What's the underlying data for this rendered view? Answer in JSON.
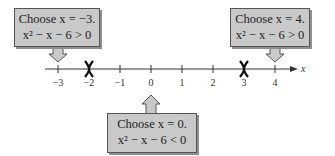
{
  "diagram": {
    "type": "sign-test-number-line",
    "axis": {
      "variable": "x",
      "ticks": [
        {
          "value": -3,
          "label": "−3",
          "x": 58
        },
        {
          "value": -2,
          "label": "−2",
          "x": 89
        },
        {
          "value": -1,
          "label": "−1",
          "x": 120
        },
        {
          "value": 0,
          "label": "0",
          "x": 151
        },
        {
          "value": 1,
          "label": "1",
          "x": 182
        },
        {
          "value": 2,
          "label": "2",
          "x": 213
        },
        {
          "value": 3,
          "label": "3",
          "x": 244
        },
        {
          "value": 4,
          "label": "4",
          "x": 275
        }
      ],
      "critical_points": [
        -2,
        3
      ]
    },
    "callouts": [
      {
        "id": "left",
        "line1": "Choose x = −3.",
        "line2": "x² − x − 6 > 0",
        "points_to": -3
      },
      {
        "id": "middle",
        "line1": "Choose x = 0.",
        "line2": "x² − x − 6 < 0",
        "points_to": 0
      },
      {
        "id": "right",
        "line1": "Choose x = 4.",
        "line2": "x² − x − 6 > 0",
        "points_to": 4
      }
    ],
    "colors": {
      "box_fill": "#c9c9c9",
      "box_border": "#555555",
      "axis": "#333333",
      "critical_mark": "#111111"
    }
  }
}
